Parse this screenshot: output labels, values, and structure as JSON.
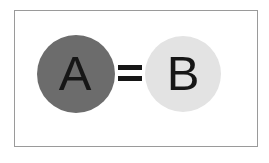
{
  "figure": {
    "type": "equivalence-diagram",
    "panel": {
      "background_color": "#ffffff",
      "border_color": "#9a9a9a"
    },
    "nodes": [
      {
        "id": "a",
        "label": "A",
        "shape": "circle",
        "fill_color": "#6c6c6c",
        "label_color": "#161616"
      },
      {
        "id": "b",
        "label": "B",
        "shape": "circle",
        "fill_color": "#e3e3e3",
        "label_color": "#161616"
      }
    ],
    "relation": {
      "symbol": "=",
      "name": "equals-sign",
      "color": "#161616"
    }
  }
}
